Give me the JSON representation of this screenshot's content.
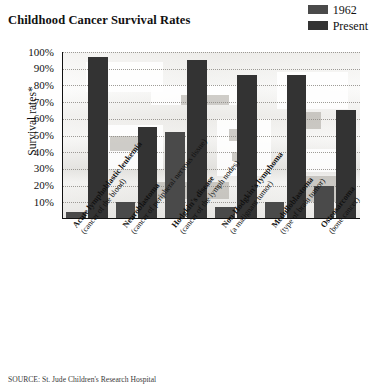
{
  "title": "Childhood Cancer Survival Rates",
  "legend": {
    "items": [
      {
        "label": "1962",
        "color": "#4a4a4a",
        "name": "legend-1962"
      },
      {
        "label": "Present",
        "color": "#333333",
        "name": "legend-present"
      }
    ]
  },
  "axis": {
    "ylabel": "Survival rates*",
    "yticks": [
      "100%",
      "90%",
      "80%",
      "70%",
      "60%",
      "50%",
      "40%",
      "30%",
      "20%",
      "10%"
    ]
  },
  "source": "SOURCE: St. Jude Children's Research Hospital",
  "chart_data": {
    "type": "bar",
    "title": "Childhood Cancer Survival Rates",
    "xlabel": "",
    "ylabel": "Survival rates*",
    "ylim": [
      0,
      100
    ],
    "ytick_values": [
      10,
      20,
      30,
      40,
      50,
      60,
      70,
      80,
      90,
      100
    ],
    "grid": true,
    "legend_position": "top-right",
    "categories": [
      "Acute lymphoblastic leukemia (cancer of the blood)",
      "Neuroblastoma (cancer of peripheral nervous tissue)",
      "Hodgkin's disease (cancer of the lymph nodes)",
      "Non-Hodgkin's lymphoma (a malignant tumor)",
      "Medulloblastoma (type of brain tumor)",
      "Osteosarcoma (bone cancer)"
    ],
    "category_lines": [
      {
        "line1": "Acute lymphoblastic leukemia",
        "line2": "(cancer of the blood)"
      },
      {
        "line1": "Neuroblastoma",
        "line2": "(cancer of peripheral nervous tissue)"
      },
      {
        "line1": "Hodgkin's disease",
        "line2": "(cancer of the lymph nodes)"
      },
      {
        "line1": "Non-Hodgkin's lymphoma",
        "line2": "(a malignant tumor)"
      },
      {
        "line1": "Medulloblastoma",
        "line2": "(type of brain tumor)"
      },
      {
        "line1": "Osteosarcoma",
        "line2": "(bone cancer)"
      }
    ],
    "series": [
      {
        "name": "1962",
        "color": "#4a4a4a",
        "values": [
          4,
          10,
          52,
          7,
          10,
          20
        ]
      },
      {
        "name": "Present",
        "color": "#333333",
        "values": [
          97,
          55,
          95,
          86,
          86,
          65
        ]
      }
    ]
  }
}
